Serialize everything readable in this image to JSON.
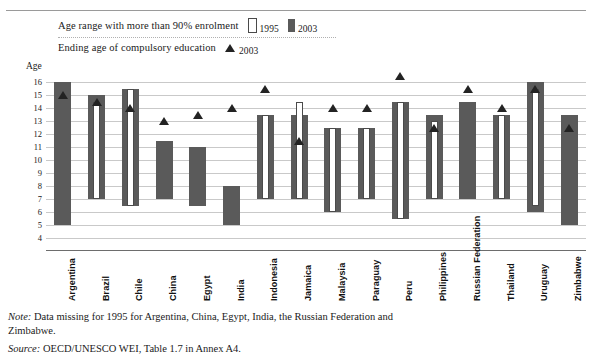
{
  "legend": {
    "range_label": "Age range with more than 90% enrolment",
    "range_1995": "1995",
    "range_2003": "2003",
    "ending_label": "Ending age of compulsory education",
    "ending_2003": "2003"
  },
  "axis_caption": "Age",
  "footnotes": {
    "note_lead": "Note:",
    "note_text": " Data missing for 1995 for Argentina, China, Egypt, India, the Russian Federation and Zimbabwe.",
    "source_lead": "Source:",
    "source_text": " OECD/UNESCO WEI, Table 1.7 in Annex A4."
  },
  "chart_data": {
    "type": "bar",
    "title": "",
    "xlabel": "",
    "ylabel": "Age",
    "ylim": [
      4,
      16
    ],
    "yticks": [
      16,
      15,
      14,
      13,
      12,
      11,
      10,
      9,
      8,
      7,
      6,
      5,
      4
    ],
    "grid": true,
    "legend_position": "top-left",
    "categories": [
      "Argentina",
      "Brazil",
      "Chile",
      "China",
      "Egypt",
      "India",
      "Indonesia",
      "Jamaica",
      "Malaysia",
      "Paraguay",
      "Peru",
      "Philippines",
      "Russian Federation",
      "Thailand",
      "Uruguay",
      "Zimbabwe"
    ],
    "series": [
      {
        "name": "1995",
        "type": "range",
        "style": "open",
        "values": [
          null,
          {
            "low": 7.0,
            "high": 14.5
          },
          {
            "low": 6.5,
            "high": 15.5
          },
          null,
          null,
          null,
          {
            "low": 7.0,
            "high": 13.5
          },
          {
            "low": 7.0,
            "high": 14.5
          },
          {
            "low": 6.0,
            "high": 12.5
          },
          {
            "low": 7.0,
            "high": 12.5
          },
          {
            "low": 5.5,
            "high": 14.5
          },
          {
            "low": 7.0,
            "high": 13.0
          },
          null,
          {
            "low": 7.0,
            "high": 13.5
          },
          {
            "low": 6.5,
            "high": 15.5
          },
          null
        ]
      },
      {
        "name": "2003",
        "type": "range",
        "style": "solid",
        "values": [
          {
            "low": 5.0,
            "high": 16.0
          },
          {
            "low": 7.0,
            "high": 15.0
          },
          {
            "low": 6.5,
            "high": 15.5
          },
          {
            "low": 7.0,
            "high": 11.5
          },
          {
            "low": 6.5,
            "high": 11.0
          },
          {
            "low": 5.0,
            "high": 8.0
          },
          {
            "low": 7.0,
            "high": 13.5
          },
          {
            "low": 7.0,
            "high": 13.5
          },
          {
            "low": 6.0,
            "high": 12.5
          },
          {
            "low": 7.0,
            "high": 12.5
          },
          {
            "low": 5.5,
            "high": 14.5
          },
          {
            "low": 7.0,
            "high": 13.5
          },
          {
            "low": 7.0,
            "high": 14.5
          },
          {
            "low": 7.0,
            "high": 13.5
          },
          {
            "low": 6.0,
            "high": 16.0
          },
          {
            "low": 5.0,
            "high": 13.5
          }
        ]
      },
      {
        "name": "Ending age of compulsory education 2003",
        "type": "marker",
        "style": "triangle",
        "values": [
          15.0,
          14.5,
          14.0,
          13.0,
          13.5,
          14.0,
          15.5,
          11.5,
          14.0,
          14.0,
          16.5,
          12.5,
          15.5,
          14.0,
          15.5,
          12.5
        ]
      }
    ]
  }
}
